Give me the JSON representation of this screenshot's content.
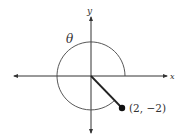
{
  "diagram": {
    "type": "angle-in-standard-position",
    "axes": {
      "x_label": "x",
      "y_label": "y",
      "origin": [
        91,
        76
      ],
      "x_extent": [
        13,
        168
      ],
      "y_extent": [
        10,
        133
      ]
    },
    "angle": {
      "label": "θ",
      "start_deg": 0,
      "end_deg": 315,
      "direction": "counterclockwise",
      "arc_radius": 34
    },
    "terminal_point": {
      "label": "(2, −2)",
      "x": 2,
      "y": -2,
      "pixel": [
        122,
        108
      ]
    },
    "colors": {
      "line": "#333333",
      "background": "#ffffff"
    }
  }
}
